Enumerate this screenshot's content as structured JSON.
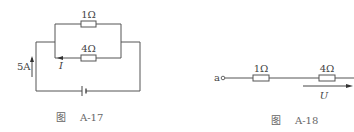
{
  "figures": [
    {
      "id": "A-17",
      "caption": {
        "prefix": "图",
        "number": "A-17"
      },
      "resistors": [
        {
          "label": "1Ω",
          "branch": "top"
        },
        {
          "label": "4Ω",
          "branch": "bottom"
        }
      ],
      "source_current": {
        "label": "5A",
        "direction": "up"
      },
      "branch_current": {
        "label": "I",
        "direction": "left"
      },
      "battery": {
        "symbol": "battery"
      }
    },
    {
      "id": "A-18",
      "caption": {
        "prefix": "图",
        "number": "A-18"
      },
      "terminal": {
        "label": "a"
      },
      "resistors": [
        {
          "label": "1Ω"
        },
        {
          "label": "4Ω"
        }
      ],
      "voltage": {
        "label": "U",
        "direction": "right"
      }
    }
  ],
  "colors": {
    "line": "#555555",
    "text": "#444444",
    "caption": "#666666",
    "background": "#ffffff"
  }
}
